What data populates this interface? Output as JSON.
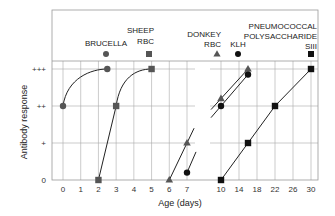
{
  "chart_data": {
    "type": "line",
    "title": "",
    "xlabel": "Age (days)",
    "ylabel": "Antibody response",
    "y_levels": [
      {
        "label": "0",
        "value": 0
      },
      {
        "label": "+",
        "value": 1
      },
      {
        "label": "++",
        "value": 2
      },
      {
        "label": "+++",
        "value": 3
      }
    ],
    "ylim": [
      0,
      3
    ],
    "x_segments": [
      {
        "ticks": [
          0,
          1,
          2,
          3,
          4,
          5,
          6,
          7
        ],
        "tick_labels": [
          "0",
          "1",
          "2",
          "3",
          "4",
          "5",
          "6",
          "7"
        ]
      },
      {
        "ticks": [
          10,
          14,
          18,
          22,
          26,
          30
        ],
        "tick_labels": [
          "10",
          "14",
          "18",
          "22",
          "26",
          "30"
        ]
      }
    ],
    "grid": true,
    "series": [
      {
        "name": "BRUCELLA",
        "label_lines": [
          "BRUCELLA"
        ],
        "marker": "circle",
        "color": "#555555",
        "curve": "saturating",
        "points": [
          {
            "x": 0,
            "y": 2
          },
          {
            "x": 2.5,
            "y": 3
          }
        ]
      },
      {
        "name": "SHEEP RBC",
        "label_lines": [
          "SHEEP",
          "RBC"
        ],
        "marker": "square",
        "color": "#555555",
        "curve": "mixed",
        "points": [
          {
            "x": 2,
            "y": 0
          },
          {
            "x": 3,
            "y": 2
          },
          {
            "x": 5,
            "y": 3
          }
        ]
      },
      {
        "name": "DONKEY RBC",
        "label_lines": [
          "DONKEY",
          "RBC"
        ],
        "marker": "triangle",
        "color": "#555555",
        "curve": "linear",
        "points": [
          {
            "x": 6,
            "y": 0
          },
          {
            "x": 7,
            "y": 1
          },
          {
            "x": 10,
            "y": 2.2
          },
          {
            "x": 16,
            "y": 3
          }
        ]
      },
      {
        "name": "KLH",
        "label_lines": [
          "KLH"
        ],
        "marker": "circle",
        "color": "#111111",
        "curve": "linear",
        "points": [
          {
            "x": 7,
            "y": 0.2
          },
          {
            "x": 10,
            "y": 2
          },
          {
            "x": 16,
            "y": 2.85
          }
        ]
      },
      {
        "name": "PNEUMOCOCCAL POLYSACCHARIDE SIII",
        "label_lines": [
          "PNEUMOCOCCAL",
          "POLYSACCHARIDE",
          "SIII"
        ],
        "marker": "square",
        "color": "#111111",
        "curve": "linear",
        "points": [
          {
            "x": 10,
            "y": 0
          },
          {
            "x": 16,
            "y": 1
          },
          {
            "x": 22,
            "y": 2
          },
          {
            "x": 30,
            "y": 3
          }
        ]
      }
    ]
  }
}
